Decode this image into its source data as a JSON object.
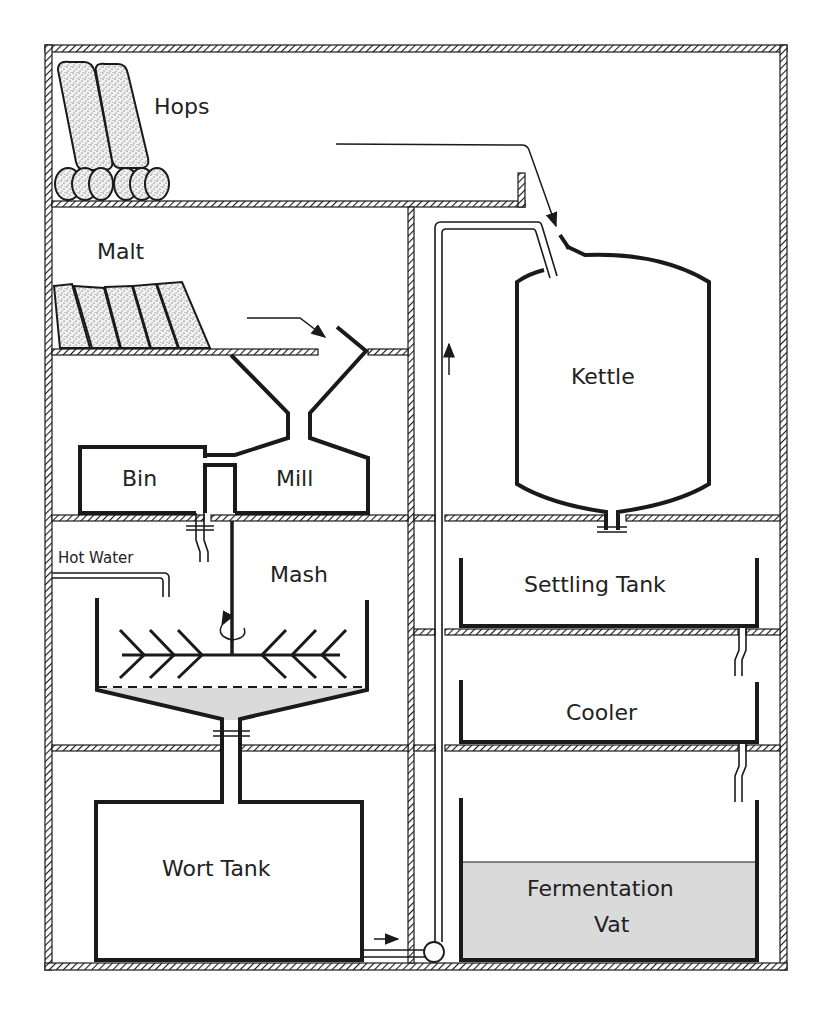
{
  "diagram": {
    "type": "brewery process cross-section",
    "labels": {
      "hops": "Hops",
      "malt": "Malt",
      "bin": "Bin",
      "mill": "Mill",
      "hot_water": "Hot Water",
      "mash": "Mash",
      "wort_tank": "Wort  Tank",
      "kettle": "Kettle",
      "settling_tank": "Settling  Tank",
      "cooler": "Cooler",
      "fermentation_vat_line1": "Fermentation",
      "fermentation_vat_line2": "Vat"
    },
    "flow": [
      {
        "from": "Malt",
        "to": "Mill"
      },
      {
        "from": "Mill",
        "to": "Bin"
      },
      {
        "from": "Bin",
        "to": "Mash"
      },
      {
        "from": "Hot Water",
        "to": "Mash"
      },
      {
        "from": "Mash",
        "to": "Wort Tank"
      },
      {
        "from": "Wort Tank",
        "to": "Kettle",
        "via": "pump"
      },
      {
        "from": "Hops",
        "to": "Kettle"
      },
      {
        "from": "Kettle",
        "to": "Settling Tank"
      },
      {
        "from": "Settling Tank",
        "to": "Cooler"
      },
      {
        "from": "Cooler",
        "to": "Fermentation Vat"
      }
    ],
    "colors": {
      "line": "#1a1a1a",
      "liquid_fill": "#dadada",
      "background": "#ffffff"
    }
  }
}
